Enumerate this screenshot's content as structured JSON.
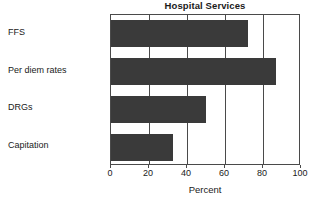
{
  "chart_data": {
    "type": "bar",
    "orientation": "horizontal",
    "title": "Hospital Services",
    "xlabel": "Percent",
    "ylabel": "",
    "categories": [
      "FFS",
      "Per diem rates",
      "DRGs",
      "Capitation"
    ],
    "values": [
      72,
      87,
      50,
      32.5
    ],
    "xlim": [
      0,
      100
    ],
    "xticks": [
      0,
      20,
      40,
      60,
      80,
      100
    ],
    "xtick_labels": [
      "0",
      "20",
      "40",
      "60",
      "80",
      "100"
    ],
    "grid": true,
    "grid_axis": "x",
    "legend": false,
    "legend_position": "none",
    "bar_color": "#3a3a3a",
    "axis_color": "#4a4a4a",
    "background_color": "#ffffff"
  }
}
